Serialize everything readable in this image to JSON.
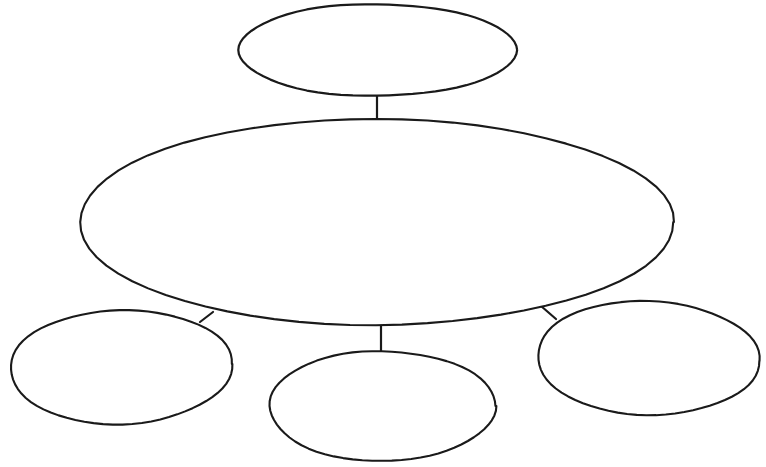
{
  "document": {
    "kind": "concept-map-graphic-organizer",
    "title": "",
    "description": "Blank concept map worksheet: one top oval linked to a large central oval, which links down to three smaller ovals.",
    "canvas": {
      "width": 766,
      "height": 467
    },
    "colors": {
      "background": "#ffffff",
      "stroke": "#1a1a1a",
      "fill": "#ffffff"
    },
    "stroke_width": 2.1
  },
  "nodes": [
    {
      "id": "node-top",
      "name": "top-oval",
      "label": "",
      "role": "heading",
      "cx": 377,
      "cy": 50,
      "rx": 139,
      "ry": 46,
      "rotation": 0,
      "stroke_width": 2.2
    },
    {
      "id": "node-center",
      "name": "center-oval",
      "label": "",
      "role": "main-topic",
      "cx": 376,
      "cy": 222,
      "rx": 297,
      "ry": 103,
      "rotation": 0,
      "stroke_width": 2.1
    },
    {
      "id": "node-bottom-left",
      "name": "bottom-left-oval",
      "label": "",
      "role": "detail",
      "cx": 121,
      "cy": 367,
      "rx": 111,
      "ry": 57,
      "rotation": -1.5,
      "stroke_width": 2.1
    },
    {
      "id": "node-bottom-center",
      "name": "bottom-center-oval",
      "label": "",
      "role": "detail",
      "cx": 382,
      "cy": 406,
      "rx": 113,
      "ry": 55,
      "rotation": 0,
      "stroke_width": 2.1
    },
    {
      "id": "node-bottom-right",
      "name": "bottom-right-oval",
      "label": "",
      "role": "detail",
      "cx": 648,
      "cy": 358,
      "rx": 111,
      "ry": 57,
      "rotation": 1.5,
      "stroke_width": 2.1
    }
  ],
  "connectors": [
    {
      "id": "connector-top",
      "name": "connector-top-to-center",
      "from": "node-top",
      "to": "node-center",
      "x1": 377,
      "y1": 95,
      "x2": 377,
      "y2": 121,
      "stroke_width": 2.2
    },
    {
      "id": "connector-left",
      "name": "connector-center-to-bottom-left",
      "from": "node-center",
      "to": "node-bottom-left",
      "x1": 213,
      "y1": 312,
      "x2": 200,
      "y2": 322,
      "stroke_width": 2.2
    },
    {
      "id": "connector-center",
      "name": "connector-center-to-bottom-center",
      "from": "node-center",
      "to": "node-bottom-center",
      "x1": 381,
      "y1": 325,
      "x2": 381,
      "y2": 353,
      "stroke_width": 2.2
    },
    {
      "id": "connector-right",
      "name": "connector-center-to-bottom-right",
      "from": "node-center",
      "to": "node-bottom-right",
      "x1": 541,
      "y1": 306,
      "x2": 556,
      "y2": 319,
      "stroke_width": 2.2
    }
  ]
}
